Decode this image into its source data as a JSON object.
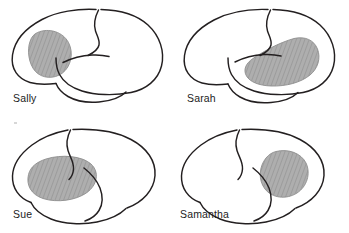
{
  "figure": {
    "background_color": "#ffffff",
    "outline_color": "#231f20",
    "lesion_fill_color": "#a8a8a8",
    "lesion_hatch_color": "#8d8d8d",
    "lesion_outline_color": "#8a8a8a",
    "label_color": "#1c1c1c",
    "grid": {
      "rows": 2,
      "columns": 2
    }
  },
  "panels": [
    {
      "id": "panel-sally",
      "label": "Sally",
      "position": "top-left",
      "lesion_region": "anterior frontal / precentral",
      "lesion_shape": "rounded oval"
    },
    {
      "id": "panel-sarah",
      "label": "Sarah",
      "position": "top-right",
      "lesion_region": "posterior superior temporal / supramarginal",
      "lesion_shape": "elongated crescent"
    },
    {
      "id": "panel-sue",
      "label": "Sue",
      "position": "bottom-left",
      "lesion_region": "large anterior frontal",
      "lesion_shape": "large rounded oval"
    },
    {
      "id": "panel-samantha",
      "label": "Samantha",
      "position": "bottom-right",
      "lesion_region": "central parietal / supramarginal",
      "lesion_shape": "small round oval"
    }
  ]
}
